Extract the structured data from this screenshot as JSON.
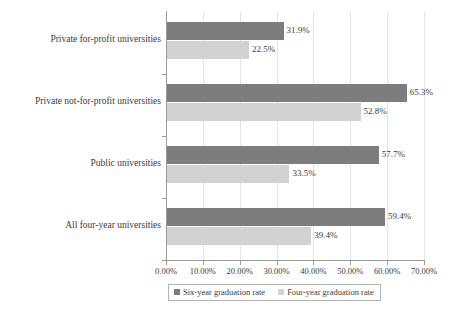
{
  "chart_data": {
    "type": "bar",
    "orientation": "horizontal",
    "title": "",
    "xlabel": "",
    "ylabel": "",
    "xlim": [
      0,
      70
    ],
    "xtick_labels": [
      "0.00%",
      "10.00%",
      "20.00%",
      "30.00%",
      "40.00%",
      "50.00%",
      "60.00%",
      "70.00%"
    ],
    "xtick_values": [
      0,
      10,
      20,
      30,
      40,
      50,
      60,
      70
    ],
    "grid": "vertical",
    "legend_position": "bottom",
    "categories": [
      "Private for-profit universities",
      "Private not-for-profit universities",
      "Public universities",
      "All four-year universities"
    ],
    "series": [
      {
        "name": "Six-year graduation rate",
        "color": "#7d7d7d",
        "values": [
          31.9,
          65.3,
          57.7,
          59.4
        ],
        "labels": [
          "31.9%",
          "65.3%",
          "57.7%",
          "59.4%"
        ]
      },
      {
        "name": "Four-year graduation rate",
        "color": "#d2d2d2",
        "values": [
          22.5,
          52.8,
          33.5,
          39.4
        ],
        "labels": [
          "22.5%",
          "52.8%",
          "33.5%",
          "39.4%"
        ]
      }
    ]
  },
  "legend": {
    "entries": [
      {
        "label": "Six-year graduation rate",
        "swatch": "six"
      },
      {
        "label": "Four-year graduation rate",
        "swatch": "four"
      }
    ]
  },
  "colors": {
    "six_year_bar": "#7d7d7d",
    "four_year_bar": "#d2d2d2",
    "axis": "#9a9a9a",
    "gridline": "#e3e3e3",
    "text": "#3b3b3b",
    "background": "#ffffff"
  }
}
